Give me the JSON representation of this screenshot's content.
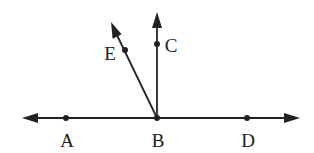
{
  "diagram": {
    "type": "geometry-rays",
    "line": {
      "name": "line AD",
      "from": [
        22,
        118
      ],
      "to": [
        300,
        118
      ],
      "arrows": "both"
    },
    "rays": [
      {
        "name": "ray BC",
        "from": [
          157,
          118
        ],
        "to": [
          157,
          12
        ]
      },
      {
        "name": "ray BE",
        "from": [
          157,
          118
        ],
        "to": [
          111,
          22
        ]
      }
    ],
    "points": [
      {
        "id": "A",
        "label": "A",
        "x": 66,
        "y": 118,
        "label_x": 67,
        "label_y": 147
      },
      {
        "id": "B",
        "label": "B",
        "x": 157,
        "y": 118,
        "label_x": 158,
        "label_y": 147
      },
      {
        "id": "D",
        "label": "D",
        "x": 247,
        "y": 118,
        "label_x": 248,
        "label_y": 147
      },
      {
        "id": "C",
        "label": "C",
        "x": 157,
        "y": 44,
        "label_x": 171,
        "label_y": 52
      },
      {
        "id": "E",
        "label": "E",
        "x": 125,
        "y": 50,
        "label_x": 110,
        "label_y": 60
      }
    ],
    "color": "#222222"
  }
}
